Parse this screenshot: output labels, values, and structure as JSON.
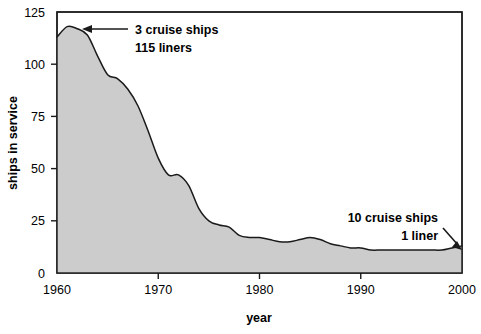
{
  "chart_data": {
    "type": "area",
    "title": "",
    "xlabel": "year",
    "ylabel": "ships in service",
    "xlim": [
      1960,
      2000
    ],
    "ylim": [
      0,
      125
    ],
    "xticks": [
      1960,
      1970,
      1980,
      1990,
      2000
    ],
    "xtick_labels": [
      "1960",
      "1970",
      "1980",
      "1990",
      "2000"
    ],
    "yticks": [
      0,
      25,
      50,
      75,
      100,
      125
    ],
    "ytick_labels": [
      "0",
      "25",
      "50",
      "75",
      "100",
      "125"
    ],
    "grid": false,
    "legend": "none",
    "fill_color": "#cccccc",
    "line_color": "#1a1a1a",
    "frame_color": "#1a1a1a",
    "x": [
      1960,
      1961,
      1962,
      1963,
      1964,
      1965,
      1966,
      1967,
      1968,
      1969,
      1970,
      1971,
      1972,
      1973,
      1974,
      1975,
      1976,
      1977,
      1978,
      1979,
      1980,
      1981,
      1982,
      1983,
      1984,
      1985,
      1986,
      1987,
      1988,
      1989,
      1990,
      1991,
      1992,
      1993,
      1994,
      1995,
      1996,
      1997,
      1998,
      1999,
      2000
    ],
    "values": [
      113,
      118,
      117,
      114,
      104,
      95,
      93,
      88,
      80,
      68,
      55,
      47,
      47,
      42,
      31,
      25,
      23,
      22,
      18,
      17,
      17,
      16,
      15,
      15,
      16,
      17,
      16,
      14,
      13,
      12,
      12,
      11,
      11,
      11,
      11,
      11,
      11,
      11,
      11,
      12,
      13
    ],
    "series_name": "ships in service",
    "annotations": [
      {
        "id": "peak-annotation",
        "lines": [
          "3 cruise ships",
          "115 liners"
        ],
        "year": 1961,
        "value": 118,
        "arrow": "left"
      },
      {
        "id": "tail-annotation",
        "lines": [
          "10 cruise ships",
          "1 liner"
        ],
        "year": 2000,
        "value": 13,
        "arrow": "down-right"
      }
    ]
  }
}
